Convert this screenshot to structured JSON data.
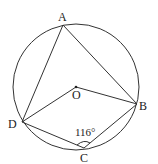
{
  "diagram": {
    "type": "inscribed-quadrilateral",
    "circle": {
      "center_label": "O",
      "cx": 76,
      "cy": 87,
      "r": 63
    },
    "points": {
      "A": {
        "label": "A",
        "x": 63,
        "y": 25,
        "lx": 58,
        "ly": 20
      },
      "B": {
        "label": "B",
        "x": 137,
        "y": 104,
        "lx": 140,
        "ly": 109
      },
      "C": {
        "label": "C",
        "x": 84,
        "y": 148,
        "lx": 80,
        "ly": 162
      },
      "D": {
        "label": "D",
        "x": 22,
        "y": 122,
        "lx": 8,
        "ly": 127
      },
      "O": {
        "label": "O",
        "x": 76,
        "y": 87,
        "lx": 72,
        "ly": 99
      }
    },
    "segments": [
      "AD",
      "AB",
      "DO",
      "OB",
      "DC",
      "CB"
    ],
    "angle_label": "116°",
    "angle_at": "C",
    "stroke_color": "#333333"
  }
}
